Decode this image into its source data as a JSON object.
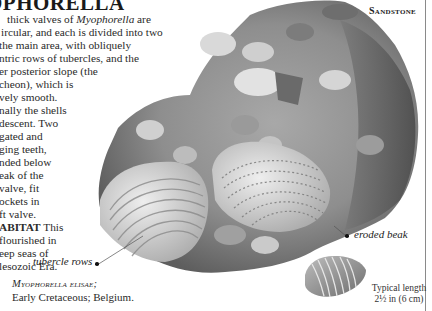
{
  "header": {
    "title": "MYOPHORELLA",
    "visible_title": "OPHORELLA",
    "section": "Sandstone"
  },
  "body_lines": [
    {
      "prefix": "thick valves of ",
      "italic": "Myophorella",
      "suffix": " are"
    },
    {
      "text": "ircular, and each is divided into two"
    },
    {
      "text": "the main area, with obliquely"
    },
    {
      "text": "ntric rows of tubercles, and the"
    },
    {
      "text": "er posterior slope (the"
    },
    {
      "text": "cheon), which is"
    },
    {
      "text": "vely smooth."
    },
    {
      "text": "nally the shells"
    },
    {
      "text": "descent. Two"
    },
    {
      "text": "gated and"
    },
    {
      "text": "ging teeth,"
    },
    {
      "text": "nded below"
    },
    {
      "text": "eak of the"
    },
    {
      "text": "valve, fit"
    },
    {
      "text": "ockets in"
    },
    {
      "text": "ft valve."
    },
    {
      "bold": "ABITAT",
      "suffix": " This"
    },
    {
      "text": "flourished in"
    },
    {
      "text": "eep seas of"
    },
    {
      "text": "lesozoic Era."
    }
  ],
  "annotations": {
    "tubercle_rows": "tubercle rows",
    "eroded_beak": "eroded beak"
  },
  "caption": {
    "species": "Myophorella elisae;",
    "details": "Early Cretaceous; Belgium."
  },
  "measurement": {
    "label": "Typical length",
    "value": "2½ in (6 cm)"
  },
  "colors": {
    "rock_dark": "#5a5a5a",
    "rock_mid": "#8c8c8c",
    "rock_light": "#c8c8c8",
    "shell_light": "#e4e4e4",
    "rule": "#8a8a8a"
  }
}
